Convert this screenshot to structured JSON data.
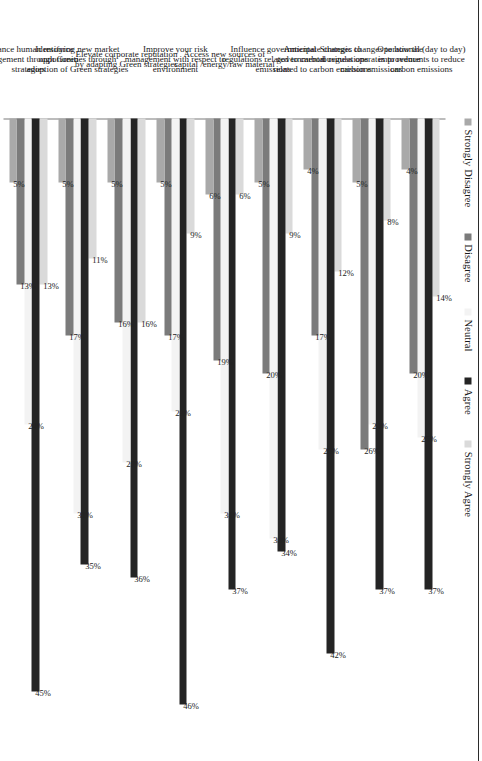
{
  "chart_data": {
    "type": "bar",
    "orientation": "horizontal-grouped-rotated",
    "title": "",
    "subtitle": "",
    "xlabel": "",
    "ylabel": "",
    "grid": false,
    "legend_position": "top",
    "value_suffix": "%",
    "xlim": [
      0,
      50
    ],
    "categories": [
      "Operational (day to day) improvements to reduce carbon emissions",
      "Strategic changes to how the business operates to reduce carbon emissions",
      "Anticipate changes to governmental regulations related to carbon emissions",
      "Influence governmental regulations related to carbon emissions",
      "Access new sources of capital /energy/raw material",
      "Improve your risk management with respect to environment",
      "Elevate corporate reputation by adapting Green strategies",
      "Identifying new market opportunities through adoption of Green strategies",
      "Enhance human resource management through Green strategies"
    ],
    "series": [
      {
        "name": "Strongly Disagree",
        "color": "#a9a9a9",
        "values": [
          4,
          5,
          4,
          5,
          6,
          5,
          5,
          5,
          5
        ],
        "labels": [
          "4%",
          "5%",
          "4%",
          "5%",
          "6%",
          "5%",
          "5%",
          "5%",
          "5%"
        ]
      },
      {
        "name": "Disagree",
        "color": "#7b7b7b",
        "values": [
          20,
          26,
          17,
          20,
          19,
          17,
          16,
          17,
          13
        ],
        "labels": [
          "20%",
          "26%",
          "17%",
          "20%",
          "19%",
          "17%",
          "16%",
          "17%",
          "13%"
        ]
      },
      {
        "name": "Neutral",
        "color": "#f3f3f3",
        "values": [
          25,
          24,
          26,
          33,
          31,
          23,
          27,
          31,
          24
        ],
        "labels": [
          "25%",
          "24%",
          "26%",
          "33%",
          "31%",
          "23%",
          "27%",
          "31%",
          "24%"
        ]
      },
      {
        "name": "Agree",
        "color": "#242424",
        "values": [
          37,
          37,
          42,
          34,
          37,
          46,
          36,
          35,
          45
        ],
        "labels": [
          "37%",
          "37%",
          "42%",
          "34%",
          "37%",
          "46%",
          "36%",
          "35%",
          "45%"
        ]
      },
      {
        "name": "Strongly Agree",
        "color": "#dadada",
        "values": [
          14,
          8,
          12,
          9,
          6,
          9,
          16,
          11,
          13
        ],
        "labels": [
          "14%",
          "8%",
          "12%",
          "9%",
          "6%",
          "9%",
          "16%",
          "11%",
          "13%"
        ]
      }
    ]
  }
}
